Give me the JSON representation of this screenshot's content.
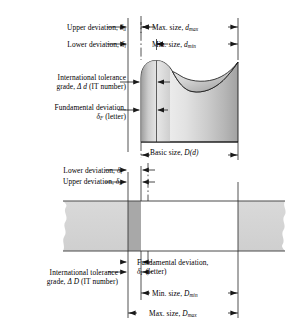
{
  "figure": {
    "type": "engineering-tolerance-diagram"
  },
  "shaft_section": {
    "labels": {
      "upper_deviation": "Upper deviation, ",
      "upper_deviation_sym": "δ",
      "upper_deviation_subscript": "u",
      "lower_deviation": "Lower deviation, ",
      "lower_deviation_sym": "δ",
      "lower_deviation_subscript": "l",
      "tolerance_grade_line1": "International tolerance",
      "tolerance_grade_line2_pre": "grade, ",
      "tolerance_grade_delta": "Δ d",
      "tolerance_grade_line2_post": " (IT number)",
      "fundamental_deviation_line1": "Fundamental deviation, ",
      "fundamental_deviation_sym": "δ",
      "fundamental_deviation_subscript": "F",
      "fundamental_deviation_line2_post": " (letter)",
      "max_size_pre": "Max. size, ",
      "max_size_sym": "d",
      "max_size_subscript": "max",
      "min_size_pre": "Min. size, ",
      "min_size_sym": "d",
      "min_size_subscript": "min",
      "basic_size_pre": "Basic size, ",
      "basic_size_sym": "D(d)"
    }
  },
  "hole_section": {
    "labels": {
      "lower_deviation": "Lower deviation, ",
      "lower_deviation_sym": "δ",
      "lower_deviation_subscript": "l",
      "upper_deviation": "Upper deviation, ",
      "upper_deviation_sym": "δ",
      "upper_deviation_subscript": "u",
      "tolerance_grade_line1": "International tolerance",
      "tolerance_grade_line2_pre": "grade, ",
      "tolerance_grade_delta": "Δ D",
      "tolerance_grade_line2_post": " (IT number)",
      "fundamental_deviation_line1": "Fundamental deviation,",
      "fundamental_deviation_sym": "δ",
      "fundamental_deviation_subscript": "F",
      "fundamental_deviation_line2_post": " (letter)",
      "min_size_pre": "Min. size, ",
      "min_size_sym": "D",
      "min_size_subscript": "min",
      "max_size_pre": "Max. size, ",
      "max_size_sym": "D",
      "max_size_subscript": "max"
    }
  },
  "colors": {
    "line": "#1a1a1a",
    "shaft_light": "#f2f2f2",
    "shaft_mid": "#c9c9c9",
    "shaft_dark": "#8f8f8f",
    "hole_fill": "#d3d3d3",
    "hole_band": "#a8a8a8",
    "background": "#ffffff"
  },
  "geometry": {
    "axis_left_x": 128,
    "axis_mid_x": 141,
    "axis_right_x": 238,
    "shaft_top_y": 60,
    "shaft_bottom_y": 142,
    "hole_top_y": 201,
    "hole_bottom_y": 251
  }
}
